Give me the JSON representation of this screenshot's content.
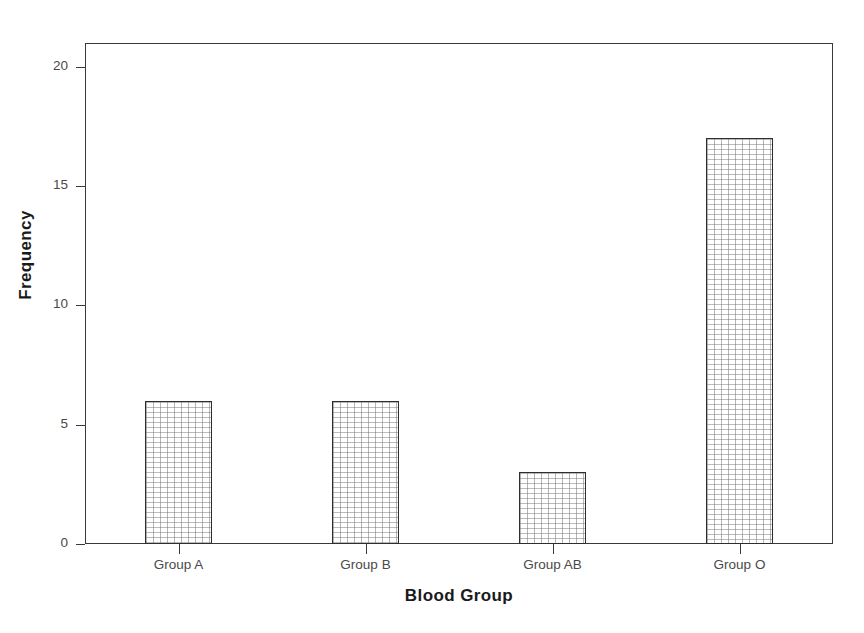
{
  "chart_data": {
    "type": "bar",
    "title": "",
    "subtitle": "",
    "xlabel": "Blood Group",
    "ylabel": "Frequency",
    "categories": [
      "Group A",
      "Group B",
      "Group AB",
      "Group O"
    ],
    "values": [
      6,
      6,
      3,
      17
    ],
    "series": [
      {
        "name": "Frequency",
        "values": [
          6,
          6,
          3,
          17
        ]
      }
    ],
    "ylim": [
      0,
      21
    ],
    "yticks": [
      0,
      5,
      10,
      15,
      20
    ],
    "ytick_labels": [
      "0",
      "5",
      "10",
      "15",
      "20"
    ],
    "grid": false,
    "legend": false,
    "legend_position": "none",
    "bar_fill": "stippled-dot-pattern",
    "bar_edge_color": "#2e2e2e",
    "axis_color": "#3a3a3a",
    "text_color": "#4a4a4a",
    "title_color": "#1a1a1a",
    "background_color": "#ffffff"
  }
}
